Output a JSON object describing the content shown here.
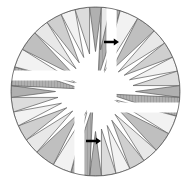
{
  "figure": {
    "background_color": "#ffffff",
    "outline_color": "#5a5a5a",
    "center": {
      "x": 95.5,
      "y": 91.5
    },
    "radius": 84.5,
    "quadrant_count": 4,
    "rotation_step_degrees": 90
  },
  "palette": {
    "white": "#ffffff",
    "lightest": "#f2f2f2",
    "lighter": "#e8e8e8",
    "light": "#dcdcdc",
    "mid_light": "#cfcfcf",
    "mid": "#bfbfbf",
    "mid_dark": "#b0b0b0",
    "dark": "#9e9e9e",
    "darkest": "#8e8e8e",
    "outline": "#5a5a5a",
    "arrow": "#000000"
  },
  "gap": {
    "name": "pinwheel-white-gap",
    "color": "#ffffff",
    "arm_half_width": 9,
    "hub_radius": 13,
    "arm_count": 4
  },
  "quadrants": [
    {
      "name": "quadrant-top-left",
      "index": 0,
      "rotation_degrees": 0,
      "wedge_count": 9
    },
    {
      "name": "quadrant-top-right",
      "index": 1,
      "rotation_degrees": 90,
      "wedge_count": 9
    },
    {
      "name": "quadrant-bottom-right",
      "index": 2,
      "rotation_degrees": 180,
      "wedge_count": 9
    },
    {
      "name": "quadrant-bottom-left",
      "index": 3,
      "rotation_degrees": 270,
      "wedge_count": 9
    }
  ],
  "wedge_template": [
    {
      "index": 0,
      "a0": 4,
      "a1": 17,
      "r_in": 14,
      "r_out": 84.5,
      "shade": "#b0b0b0",
      "hatched": true,
      "label": "inner-dark-wedge"
    },
    {
      "index": 1,
      "a0": 17,
      "a1": 30,
      "r_in": 20,
      "r_out": 84.5,
      "shade": "#f2f2f2",
      "hatched": false,
      "label": "wedge-2"
    },
    {
      "index": 2,
      "a0": 30,
      "a1": 44,
      "r_in": 26,
      "r_out": 84.5,
      "shade": "#bfbfbf",
      "hatched": false,
      "label": "wedge-3"
    },
    {
      "index": 3,
      "a0": 44,
      "a1": 55,
      "r_in": 30,
      "r_out": 84.5,
      "shade": "#e8e8e8",
      "hatched": false,
      "label": "wedge-4"
    },
    {
      "index": 4,
      "a0": 55,
      "a1": 66,
      "r_in": 33,
      "r_out": 84.5,
      "shade": "#cfcfcf",
      "hatched": false,
      "label": "wedge-5"
    },
    {
      "index": 5,
      "a0": 66,
      "a1": 76,
      "r_in": 36,
      "r_out": 84.5,
      "shade": "#f2f2f2",
      "hatched": false,
      "label": "wedge-6"
    },
    {
      "index": 6,
      "a0": 76,
      "a1": 86,
      "r_in": 38,
      "r_out": 84.5,
      "shade": "#dcdcdc",
      "hatched": false,
      "label": "wedge-7"
    },
    {
      "index": 7,
      "a0": 86,
      "a1": 94,
      "r_in": 40,
      "r_out": 84.5,
      "shade": "#b0b0b0",
      "hatched": false,
      "label": "wedge-8"
    },
    {
      "index": 8,
      "a0": 94,
      "a1": 100,
      "r_in": 42,
      "r_out": 84.5,
      "shade": "#e8e8e8",
      "hatched": false,
      "label": "wedge-9"
    }
  ],
  "arrows": [
    {
      "name": "arrow-upper",
      "x": 104,
      "y": 42,
      "direction": "right",
      "length": 15,
      "color": "#000000"
    },
    {
      "name": "arrow-lower",
      "x": 86,
      "y": 141,
      "direction": "right",
      "length": 15,
      "color": "#000000"
    }
  ]
}
